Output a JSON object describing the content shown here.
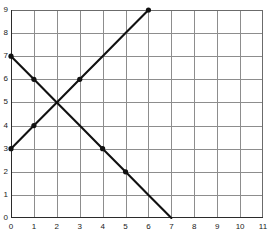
{
  "chart_data": {
    "type": "line",
    "title": "",
    "xlabel": "",
    "ylabel": "",
    "xlim": [
      0,
      11
    ],
    "ylim": [
      0,
      9
    ],
    "grid": true,
    "legend": "none",
    "x_ticks": [
      "0",
      "1",
      "2",
      "3",
      "4",
      "5",
      "6",
      "7",
      "8",
      "9",
      "10",
      "11"
    ],
    "y_ticks": [
      "0",
      "1",
      "2",
      "3",
      "4",
      "5",
      "6",
      "7",
      "8",
      "9"
    ],
    "intersection": {
      "x": 2,
      "y": 5,
      "label": "(2, 5)"
    },
    "series": [
      {
        "name": "ascending-line",
        "color": "#111111",
        "slope": 1,
        "intercept": 3,
        "points": [
          {
            "x": 0,
            "y": 3,
            "marker": true
          },
          {
            "x": 1,
            "y": 4,
            "marker": true
          },
          {
            "x": 2,
            "y": 5,
            "marker": false
          },
          {
            "x": 3,
            "y": 6,
            "marker": true
          },
          {
            "x": 4,
            "y": 7,
            "marker": false
          },
          {
            "x": 5,
            "y": 8,
            "marker": false
          },
          {
            "x": 6,
            "y": 9,
            "marker": true
          }
        ]
      },
      {
        "name": "descending-line",
        "color": "#111111",
        "slope": -1,
        "intercept": 7,
        "points": [
          {
            "x": 0,
            "y": 7,
            "marker": true
          },
          {
            "x": 1,
            "y": 6,
            "marker": true
          },
          {
            "x": 2,
            "y": 5,
            "marker": false
          },
          {
            "x": 3,
            "y": 4,
            "marker": false
          },
          {
            "x": 4,
            "y": 3,
            "marker": true
          },
          {
            "x": 5,
            "y": 2,
            "marker": true
          },
          {
            "x": 6,
            "y": 1,
            "marker": false
          },
          {
            "x": 7,
            "y": 0,
            "marker": false
          }
        ]
      }
    ]
  }
}
